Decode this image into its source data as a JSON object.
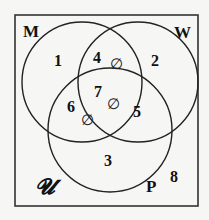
{
  "diagram": {
    "type": "venn-3",
    "universe_label": "𝓤",
    "sets": [
      {
        "id": "M",
        "label": "M"
      },
      {
        "id": "W",
        "label": "W"
      },
      {
        "id": "P",
        "label": "P"
      }
    ],
    "regions": [
      {
        "id": "1",
        "label": "1",
        "membership": "M only"
      },
      {
        "id": "2",
        "label": "2",
        "membership": "W only"
      },
      {
        "id": "3",
        "label": "3",
        "membership": "P only"
      },
      {
        "id": "4",
        "label": "4",
        "membership": "M and W only",
        "empty": true
      },
      {
        "id": "5",
        "label": "5",
        "membership": "W and P only"
      },
      {
        "id": "6",
        "label": "6",
        "membership": "M and P only",
        "empty": true
      },
      {
        "id": "7",
        "label": "7",
        "membership": "M and W and P",
        "empty": true
      },
      {
        "id": "8",
        "label": "8",
        "membership": "outside all sets"
      }
    ],
    "empty_symbol": "∅",
    "colors": {
      "line": "#222222",
      "text": "#111111",
      "background": "#f6f6f4"
    }
  }
}
